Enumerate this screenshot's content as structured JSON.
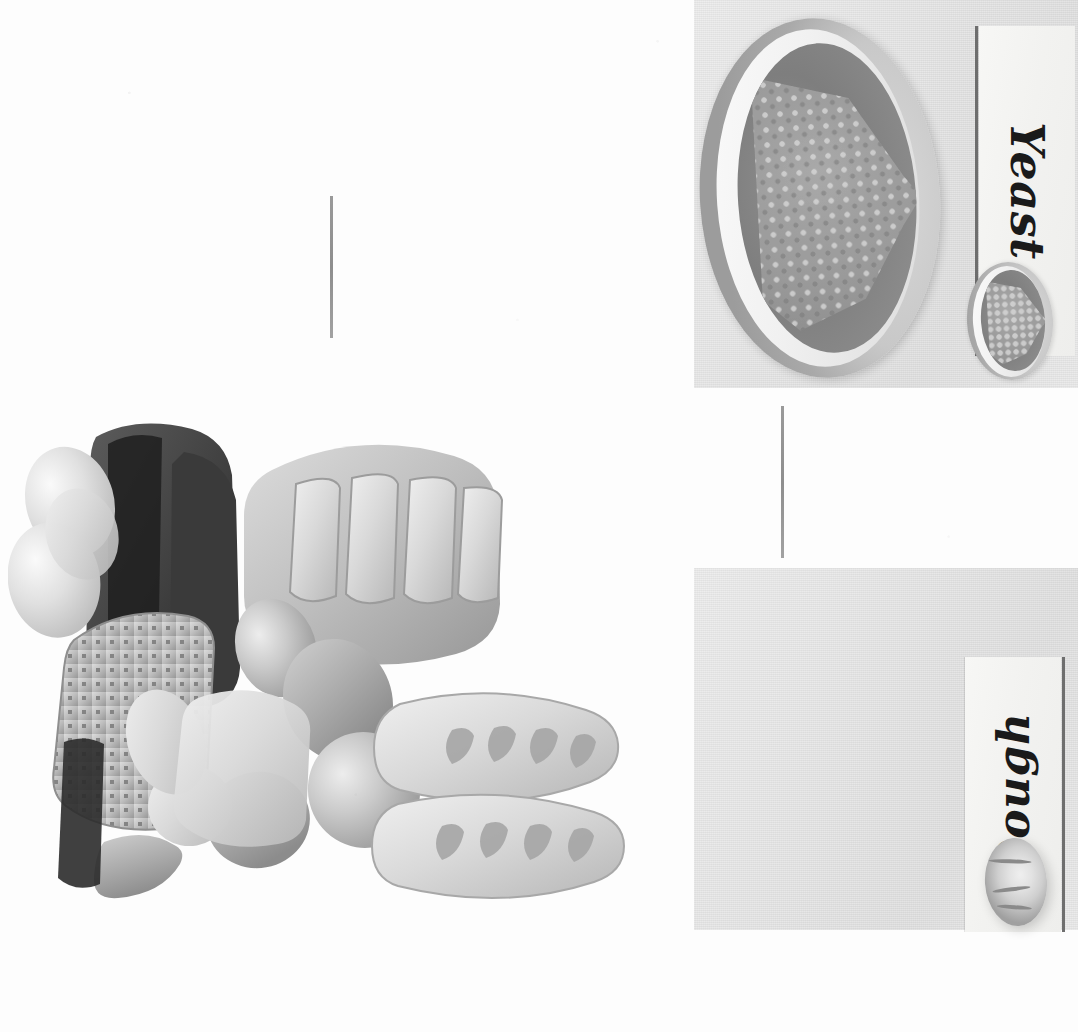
{
  "figure": {
    "kind": "scanned-grayscale-figure",
    "orientation": "sideways (page rotated 90 degrees)",
    "background_color": "#fdfdfd"
  },
  "panels": [
    {
      "id": "yeast",
      "label": "Yeast",
      "label_rotation_deg": 90,
      "subject": "bowl of granular yeast",
      "background_color": "#e3e3e3",
      "label_color": "#1a1a1a",
      "strip_color": "#f4f4f2",
      "items": [
        {
          "name": "bowl-of-yeast-large",
          "description": "open round bowl filled with a heaped mound of granular yeast"
        },
        {
          "name": "bowl-of-yeast-small",
          "description": "smaller repeat of the yeast mound beside the caption strip"
        }
      ]
    },
    {
      "id": "dough",
      "label": "Dough",
      "label_rotation_deg": -90,
      "subject": "risen ball of dough",
      "background_color": "#e3e3e3",
      "label_color": "#1a1a1a",
      "strip_color": "#f4f4f2",
      "items": [
        {
          "name": "dough-ball-large",
          "description": "large oval risen dough ball with surface score marks"
        },
        {
          "name": "dough-ball-small",
          "description": "smaller repeat of the dough ball beside the caption strip"
        }
      ]
    }
  ],
  "connectors": [
    {
      "name": "rule-top-left",
      "orientation": "vertical",
      "color": "#969696"
    },
    {
      "name": "rule-between-panels",
      "orientation": "vertical",
      "color": "#8e8e8e"
    }
  ],
  "illustration": {
    "name": "assorted-bread-arrangement",
    "description": "3D rendered grayscale arrangement of assorted baked breads",
    "breads": [
      "baguette",
      "baguette",
      "split-top-loaf",
      "round-roll",
      "round-roll",
      "round-roll",
      "seeded-flatbread",
      "dark-rye-loaf",
      "dark-rye-loaf",
      "dinner-roll",
      "dinner-roll",
      "batard",
      "crescent-roll"
    ],
    "palette": {
      "lightest": "#e8e8e8",
      "light": "#cfcfcf",
      "mid": "#b0b0b0",
      "dark": "#7b7b7b",
      "darkest": "#2e2e2e"
    }
  }
}
